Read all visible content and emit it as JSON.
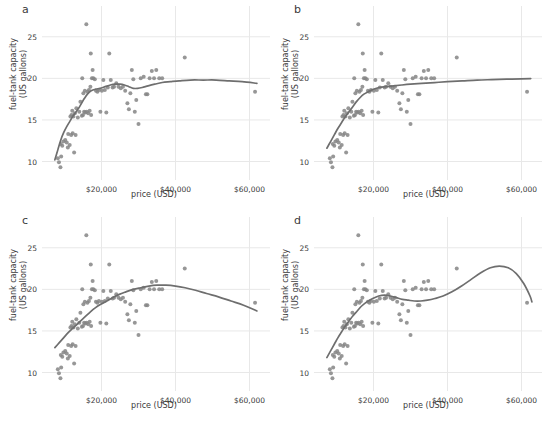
{
  "figure": {
    "width": 544,
    "height": 423,
    "background": "#ffffff",
    "point_color": "#858585",
    "line_color": "#6e6e6e",
    "grid_color": "#e8e8e8",
    "text_color": "#3a3a3a"
  },
  "chart_data": {
    "type": "scatter",
    "title": "",
    "xlabel": "price (USD)",
    "ylabel": "fuel-tank capacity\n(US gallons)",
    "xlim": [
      5000,
      65000
    ],
    "ylim": [
      8.5,
      27.5
    ],
    "xticks": [
      20000,
      40000,
      60000
    ],
    "xticklabels": [
      "$20,000",
      "$40,000",
      "$60,000"
    ],
    "yticks": [
      10,
      15,
      20,
      25
    ],
    "yticklabels": [
      "10",
      "15",
      "20",
      "25"
    ],
    "grid": true,
    "legend": "none",
    "panels": [
      {
        "label": "a",
        "fit_description": "wiggly local smoother, small span",
        "fit_points": [
          [
            7400,
            10.2
          ],
          [
            8200,
            11.4
          ],
          [
            9000,
            12.6
          ],
          [
            9800,
            13.5
          ],
          [
            10600,
            14.2
          ],
          [
            11400,
            14.8
          ],
          [
            12200,
            15.4
          ],
          [
            13000,
            15.9
          ],
          [
            13800,
            16.4
          ],
          [
            14600,
            17.0
          ],
          [
            15400,
            17.6
          ],
          [
            16200,
            18.1
          ],
          [
            17200,
            18.5
          ],
          [
            18400,
            18.7
          ],
          [
            19600,
            18.8
          ],
          [
            21000,
            19.0
          ],
          [
            22400,
            19.2
          ],
          [
            23800,
            19.3
          ],
          [
            25000,
            19.3
          ],
          [
            26200,
            19.2
          ],
          [
            27400,
            19.0
          ],
          [
            28600,
            18.8
          ],
          [
            29800,
            18.8
          ],
          [
            31000,
            18.9
          ],
          [
            32600,
            19.1
          ],
          [
            34400,
            19.3
          ],
          [
            36400,
            19.5
          ],
          [
            38600,
            19.6
          ],
          [
            41000,
            19.7
          ],
          [
            44000,
            19.8
          ],
          [
            47500,
            19.8
          ],
          [
            51000,
            19.8
          ],
          [
            54500,
            19.7
          ],
          [
            58000,
            19.6
          ],
          [
            62000,
            19.4
          ]
        ]
      },
      {
        "label": "b",
        "fit_description": "monotone saturating smoother, large span",
        "fit_points": [
          [
            7400,
            11.6
          ],
          [
            8400,
            12.4
          ],
          [
            9400,
            13.2
          ],
          [
            10400,
            14.0
          ],
          [
            11400,
            14.7
          ],
          [
            12400,
            15.4
          ],
          [
            13400,
            16.0
          ],
          [
            14400,
            16.6
          ],
          [
            15400,
            17.2
          ],
          [
            16400,
            17.7
          ],
          [
            17400,
            18.1
          ],
          [
            18600,
            18.4
          ],
          [
            20000,
            18.7
          ],
          [
            21600,
            18.9
          ],
          [
            23400,
            19.0
          ],
          [
            25400,
            19.1
          ],
          [
            27600,
            19.2
          ],
          [
            30000,
            19.3
          ],
          [
            33000,
            19.4
          ],
          [
            36500,
            19.5
          ],
          [
            40000,
            19.6
          ],
          [
            44000,
            19.7
          ],
          [
            48000,
            19.8
          ],
          [
            52000,
            19.85
          ],
          [
            56000,
            19.9
          ],
          [
            60000,
            19.95
          ],
          [
            62500,
            19.98
          ]
        ]
      },
      {
        "label": "c",
        "fit_description": "quadratic-like fit peaking near $36,000 then declining",
        "fit_points": [
          [
            7400,
            13.0
          ],
          [
            8600,
            13.6
          ],
          [
            9800,
            14.2
          ],
          [
            11000,
            14.8
          ],
          [
            12200,
            15.3
          ],
          [
            13400,
            15.8
          ],
          [
            14600,
            16.3
          ],
          [
            15800,
            16.8
          ],
          [
            17000,
            17.3
          ],
          [
            18400,
            17.8
          ],
          [
            19800,
            18.2
          ],
          [
            21400,
            18.6
          ],
          [
            23000,
            19.0
          ],
          [
            24800,
            19.4
          ],
          [
            26600,
            19.7
          ],
          [
            28600,
            20.0
          ],
          [
            30600,
            20.2
          ],
          [
            32800,
            20.4
          ],
          [
            35000,
            20.5
          ],
          [
            37400,
            20.5
          ],
          [
            40000,
            20.4
          ],
          [
            42600,
            20.2
          ],
          [
            45400,
            19.9
          ],
          [
            48400,
            19.5
          ],
          [
            51600,
            19.1
          ],
          [
            55000,
            18.6
          ],
          [
            58400,
            18.1
          ],
          [
            62000,
            17.4
          ]
        ]
      },
      {
        "label": "d",
        "fit_description": "higher-order polynomial with plateau then rise to peak near $52,000 and sharp fall",
        "fit_points": [
          [
            7400,
            11.8
          ],
          [
            8400,
            12.6
          ],
          [
            9400,
            13.4
          ],
          [
            10400,
            14.2
          ],
          [
            11400,
            14.9
          ],
          [
            12400,
            15.6
          ],
          [
            13400,
            16.2
          ],
          [
            14400,
            16.8
          ],
          [
            15600,
            17.4
          ],
          [
            16800,
            18.0
          ],
          [
            18200,
            18.5
          ],
          [
            19800,
            18.9
          ],
          [
            21400,
            19.2
          ],
          [
            23000,
            19.3
          ],
          [
            24600,
            19.2
          ],
          [
            26200,
            19.0
          ],
          [
            27800,
            18.8
          ],
          [
            29400,
            18.7
          ],
          [
            31000,
            18.6
          ],
          [
            32800,
            18.6
          ],
          [
            34600,
            18.7
          ],
          [
            36600,
            18.9
          ],
          [
            38800,
            19.2
          ],
          [
            41200,
            19.7
          ],
          [
            43800,
            20.4
          ],
          [
            46400,
            21.2
          ],
          [
            49000,
            22.0
          ],
          [
            51600,
            22.6
          ],
          [
            54000,
            22.8
          ],
          [
            56400,
            22.6
          ],
          [
            58600,
            21.9
          ],
          [
            60600,
            20.7
          ],
          [
            62300,
            19.2
          ],
          [
            62800,
            18.5
          ]
        ]
      }
    ],
    "points": [
      [
        15900,
        26.5
      ],
      [
        8500,
        9.9
      ],
      [
        8900,
        9.3
      ],
      [
        8200,
        10.4
      ],
      [
        9100,
        10.6
      ],
      [
        9400,
        11.9
      ],
      [
        9000,
        12.1
      ],
      [
        9700,
        12.4
      ],
      [
        10200,
        12.6
      ],
      [
        10600,
        12.3
      ],
      [
        11000,
        13.3
      ],
      [
        11400,
        12.0
      ],
      [
        10900,
        11.7
      ],
      [
        11800,
        13.2
      ],
      [
        12200,
        13.4
      ],
      [
        12600,
        11.1
      ],
      [
        13000,
        13.2
      ],
      [
        11600,
        15.4
      ],
      [
        11900,
        15.6
      ],
      [
        12100,
        16.1
      ],
      [
        12400,
        15.4
      ],
      [
        12800,
        15.8
      ],
      [
        13200,
        16.4
      ],
      [
        13600,
        15.3
      ],
      [
        14000,
        16.0
      ],
      [
        14300,
        17.2
      ],
      [
        14700,
        15.5
      ],
      [
        15000,
        15.6
      ],
      [
        15300,
        16.0
      ],
      [
        15600,
        15.9
      ],
      [
        15100,
        18.2
      ],
      [
        15500,
        18.5
      ],
      [
        14800,
        20.0
      ],
      [
        16000,
        16.0
      ],
      [
        16400,
        15.8
      ],
      [
        16800,
        16.1
      ],
      [
        17200,
        15.6
      ],
      [
        16200,
        18.4
      ],
      [
        16600,
        18.6
      ],
      [
        17000,
        19.0
      ],
      [
        17400,
        20.0
      ],
      [
        17600,
        21.0
      ],
      [
        17100,
        23.0
      ],
      [
        17800,
        20.0
      ],
      [
        18200,
        19.9
      ],
      [
        18500,
        18.5
      ],
      [
        18900,
        18.4
      ],
      [
        19300,
        18.6
      ],
      [
        19700,
        16.0
      ],
      [
        20100,
        18.5
      ],
      [
        20500,
        19.8
      ],
      [
        20900,
        18.6
      ],
      [
        21300,
        15.9
      ],
      [
        21700,
        18.9
      ],
      [
        22100,
        23.0
      ],
      [
        22500,
        19.8
      ],
      [
        23000,
        18.9
      ],
      [
        23400,
        19.0
      ],
      [
        24000,
        19.4
      ],
      [
        24600,
        19.0
      ],
      [
        25200,
        18.8
      ],
      [
        25800,
        19.0
      ],
      [
        26400,
        18.5
      ],
      [
        27000,
        17.0
      ],
      [
        27400,
        16.3
      ],
      [
        27800,
        18.2
      ],
      [
        28200,
        21.0
      ],
      [
        28600,
        19.9
      ],
      [
        29000,
        16.0
      ],
      [
        29400,
        17.4
      ],
      [
        30000,
        14.5
      ],
      [
        30600,
        20.0
      ],
      [
        31400,
        20.2
      ],
      [
        32000,
        18.1
      ],
      [
        32400,
        18.1
      ],
      [
        33000,
        20.0
      ],
      [
        33600,
        20.9
      ],
      [
        34200,
        20.0
      ],
      [
        34800,
        21.0
      ],
      [
        35600,
        20.0
      ],
      [
        36400,
        20.0
      ],
      [
        42500,
        22.5
      ],
      [
        61500,
        18.4
      ]
    ]
  }
}
